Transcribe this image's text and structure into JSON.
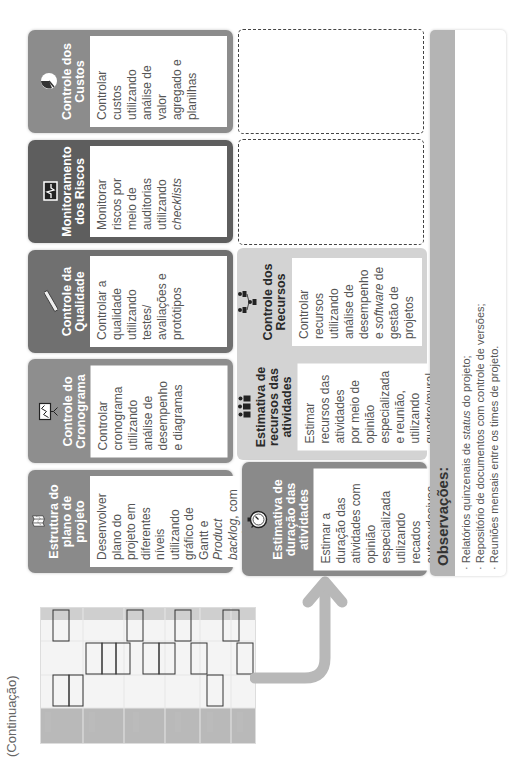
{
  "page": {
    "continuation_label": "(Continuação)"
  },
  "colors": {
    "custos_header": "#8c8c8c",
    "riscos_header": "#5e5e5e",
    "qualidade_header": "#707070",
    "cronograma_header": "#8e8e8e",
    "estrutura_header": "#8a8a8a",
    "duracao_header": "#8a8a8a",
    "light_panel": "#d3d3d3",
    "arrow": "#b8b8b8"
  },
  "cards": [
    {
      "id": "custos",
      "title": "Controle dos Custos",
      "icon": "pie-chart-icon",
      "text": "Controlar custos utilizando análise de valor agregado e planilhas"
    },
    {
      "id": "riscos",
      "title": "Monitoramento dos Riscos",
      "icon": "heartbeat-monitor-icon",
      "text_before": "Monitorar riscos por meio de auditorias utilizando ",
      "text_italic": "checklists"
    },
    {
      "id": "qualidade",
      "title": "Controle da Qualidade",
      "icon": "ruler-icon",
      "text": "Controlar a qualidade utilizando testes/ avaliações e protótipos"
    },
    {
      "id": "cronograma",
      "title": "Controle do Cronograma",
      "icon": "chart-board-icon",
      "text": "Controlar cronograma utilizando análise de desempenho e diagramas"
    },
    {
      "id": "estrutura",
      "title": "Estrutura do plano de projeto",
      "icon": "folded-map-icon",
      "text_p1": "Desenvolver plano do projeto em diferentes níveis utilizando gráfico de Gantt e ",
      "text_i1": "Product backlog",
      "text_p2": ", com uso de ",
      "text_i2": "softwares",
      "text_p3": " de gestão de projetos"
    }
  ],
  "second_row": [
    {
      "id": "recursos",
      "title": "Controle dos Recursos",
      "icon": "org-chart-people-icon",
      "text_p1": "Controlar recursos utilizando análise de desempenho e ",
      "text_i1": "software",
      "text_p2": " de gestão de projetos"
    },
    {
      "id": "estimativa_recursos",
      "title": "Estimativa de recursos das atividades",
      "icon": "team-people-icon",
      "text": "Estimar recursos das atividades por meio de opinião especializada e reunião, utilizando quadro/mural"
    },
    {
      "id": "estimativa_duracao",
      "title": "Estimativa de duração das atividades",
      "icon": "stopwatch-icon",
      "text": "Estimar a duração das atividades com opinião especializada utilizando recados autoaudesivos"
    }
  ],
  "observations": {
    "title": "Observações:",
    "items": [
      {
        "p1": "· Relatórios quinzenais de ",
        "i": "status",
        "p2": " do projeto;"
      },
      {
        "p1": "· Repositório de documentos com controle de versões;"
      },
      {
        "p1": "· Reuniões mensais entre os times de projeto."
      }
    ]
  }
}
